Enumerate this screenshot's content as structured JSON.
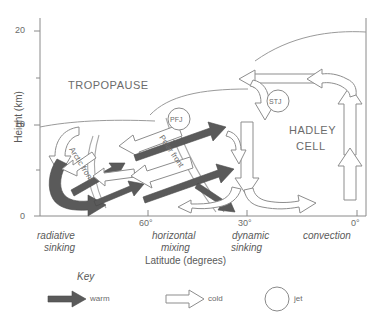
{
  "figure": {
    "type": "diagram",
    "axes": {
      "y": {
        "label": "Height (km)",
        "ticks": [
          "0",
          "10",
          "20"
        ],
        "minor_ticks": [
          "5",
          "15"
        ],
        "range": [
          0,
          22
        ]
      },
      "x": {
        "label": "Latitude (degrees)",
        "ticks": [
          "60°",
          "30°",
          "0°"
        ],
        "range_deg": [
          75,
          0
        ]
      }
    },
    "region_labels": [
      {
        "id": "radiative-sinking",
        "line1": "radiative",
        "line2": "sinking"
      },
      {
        "id": "horizontal-mixing",
        "line1": "horizontal",
        "line2": "mixing"
      },
      {
        "id": "dynamic-sinking",
        "line1": "dynamic",
        "line2": "sinking"
      },
      {
        "id": "convection",
        "line1": "convection",
        "line2": ""
      }
    ],
    "annotations": {
      "tropopause": "TROPOPAUSE",
      "hadley_line1": "HADLEY",
      "hadley_line2": "CELL",
      "polar_front_jet": "PFJ",
      "subtropical_jet": "STJ",
      "arctic_front": "Arctic front",
      "polar_front": "Polar front"
    },
    "key": {
      "title": "Key",
      "items": [
        {
          "id": "warm",
          "label": "warm",
          "glyph": "filled-arrow-icon",
          "color": "#5a5a5a"
        },
        {
          "id": "cold",
          "label": "cold",
          "glyph": "hollow-arrow-icon",
          "color": "#ffffff"
        },
        {
          "id": "jet",
          "label": "jet",
          "glyph": "circle-icon",
          "color": "#ffffff"
        }
      ]
    },
    "colors": {
      "warm_fill": "#5a5a5a",
      "cold_fill": "#ffffff",
      "outline": "#7d7d7d",
      "axis": "#8a8a8a",
      "text": "#5a5a5a"
    }
  }
}
